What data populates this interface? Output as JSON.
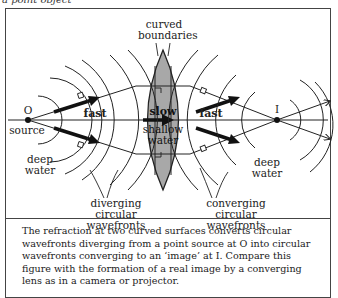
{
  "top_caption": "a point object",
  "labels": {
    "curved_boundaries": [
      "curved",
      "boundaries"
    ],
    "source_point": "O",
    "source": "source",
    "fast_left": "fast",
    "slow": "slow",
    "shallow_water": [
      "shallow",
      "water"
    ],
    "fast_right": "fast",
    "image_point": "I",
    "deep_water_left": [
      "deep",
      "water"
    ],
    "deep_water_right": [
      "deep",
      "water"
    ],
    "diverging": [
      "diverging",
      "circular wavefronts"
    ],
    "converging": [
      "converging",
      "circular wavefronts"
    ]
  },
  "caption": "The refraction at two curved surfaces converts circular wavefronts diverging from a point source at O into circular wavefronts converging to an ‘image’ at I. Compare this figure with the formation of a real image by a converging lens as in a camera or projector.",
  "colors": {
    "lens_fill": "#a8a8a8",
    "line": "#222222",
    "frame": "#444444"
  }
}
